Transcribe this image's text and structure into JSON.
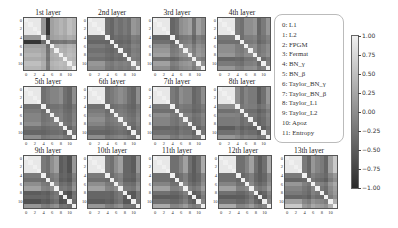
{
  "chart_data": {
    "type": "heatmap",
    "title": "",
    "colormap": "gray",
    "vmin": -1.0,
    "vmax": 1.0,
    "colorbar_ticks": [
      "1.00",
      "0.75",
      "0.50",
      "0.25",
      "0.00",
      "−0.25",
      "−0.50",
      "−0.75",
      "−1.00"
    ],
    "axis_ticks": [
      "0",
      "2",
      "4",
      "6",
      "8",
      "10"
    ],
    "legend": [
      "0:  L1",
      "1:  L2",
      "2:  FPGM",
      "3:  Fermat",
      "4:  BN_γ",
      "5:  BN_β",
      "6:  Taylor_BN_γ",
      "7:  Taylor_BN_β",
      "8:  Taylor_L1",
      "9:  Taylor_L2",
      "10:  Apoz",
      "11:  Entropy"
    ],
    "panels": [
      {
        "title": "1st layer",
        "profile": [
          0.9,
          0.9,
          0.9,
          0.9,
          0.1,
          -0.9,
          0.2,
          0.3,
          0.4,
          0.3,
          0.5,
          0.4
        ],
        "cross": 0.1
      },
      {
        "title": "2nd layer",
        "profile": [
          0.9,
          0.9,
          0.9,
          0.9,
          -0.3,
          -0.4,
          -0.2,
          -0.3,
          -0.2,
          -0.3,
          0.1,
          0.0
        ],
        "cross": -0.2
      },
      {
        "title": "3rd layer",
        "profile": [
          0.9,
          0.9,
          0.9,
          0.9,
          -0.4,
          -0.3,
          0.0,
          0.1,
          0.2,
          -0.3,
          0.2,
          0.0
        ],
        "cross": -0.2
      },
      {
        "title": "4th layer",
        "profile": [
          0.9,
          0.9,
          0.9,
          0.9,
          -0.2,
          -0.3,
          0.0,
          0.0,
          0.1,
          -0.4,
          -0.2,
          0.1
        ],
        "cross": -0.2
      },
      {
        "title": "5th layer",
        "profile": [
          0.9,
          0.9,
          0.9,
          0.9,
          -0.3,
          -0.2,
          -0.1,
          -0.1,
          0.0,
          -0.3,
          -0.4,
          0.0
        ],
        "cross": -0.25
      },
      {
        "title": "6th layer",
        "profile": [
          0.9,
          0.9,
          0.9,
          0.9,
          -0.3,
          -0.2,
          -0.1,
          0.0,
          -0.1,
          -0.3,
          -0.4,
          0.0
        ],
        "cross": -0.25
      },
      {
        "title": "7th layer",
        "profile": [
          0.9,
          0.9,
          0.9,
          0.9,
          -0.2,
          -0.3,
          0.0,
          -0.1,
          -0.1,
          -0.4,
          -0.3,
          0.0
        ],
        "cross": -0.25
      },
      {
        "title": "8th layer",
        "profile": [
          0.9,
          0.9,
          0.9,
          0.9,
          0.0,
          -0.3,
          -0.1,
          -0.2,
          -0.2,
          -0.5,
          -0.3,
          0.1
        ],
        "cross": -0.25
      },
      {
        "title": "9th layer",
        "profile": [
          0.9,
          0.9,
          0.9,
          0.9,
          -0.2,
          -0.3,
          0.0,
          0.2,
          -0.5,
          -0.4,
          -0.6,
          0.1
        ],
        "cross": -0.3
      },
      {
        "title": "10th layer",
        "profile": [
          0.9,
          0.9,
          0.9,
          0.9,
          -0.2,
          -0.3,
          0.0,
          0.2,
          -0.4,
          -0.4,
          -0.5,
          0.1
        ],
        "cross": -0.3
      },
      {
        "title": "11th layer",
        "profile": [
          0.9,
          0.9,
          0.9,
          0.9,
          -0.3,
          -0.3,
          -0.1,
          0.2,
          -0.3,
          -0.5,
          -0.3,
          0.3
        ],
        "cross": -0.3
      },
      {
        "title": "12th layer",
        "profile": [
          0.9,
          0.9,
          0.9,
          0.9,
          -0.3,
          -0.3,
          -0.1,
          0.2,
          -0.3,
          -0.5,
          -0.3,
          0.3
        ],
        "cross": -0.3
      },
      {
        "title": "13th layer",
        "profile": [
          0.9,
          0.9,
          0.9,
          0.9,
          -0.2,
          -0.4,
          0.1,
          -0.1,
          -0.2,
          -0.4,
          0.2,
          0.6
        ],
        "cross": -0.25
      }
    ]
  }
}
